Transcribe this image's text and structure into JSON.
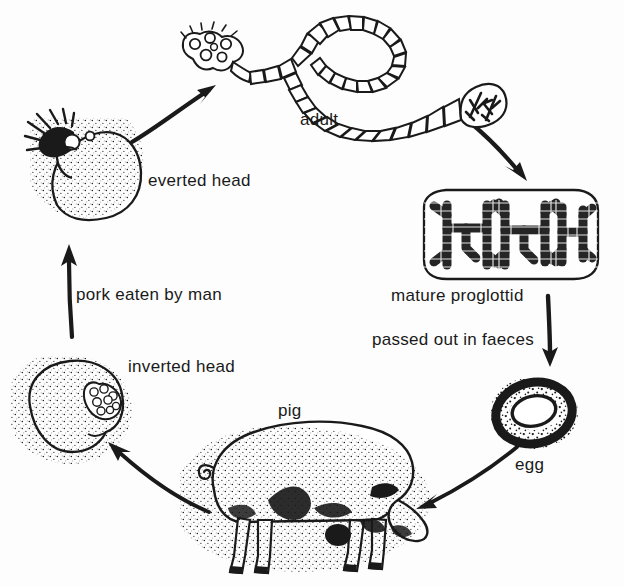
{
  "figure": {
    "kind": "life-cycle-diagram",
    "background_color": "#fdfdfd",
    "ink_color": "#1a1a1a",
    "width": 624,
    "height": 586
  },
  "labels": {
    "adult": "adult",
    "everted_head": "everted head",
    "pork_eaten_by_man": "pork eaten by man",
    "inverted_head": "inverted head",
    "pig": "pig",
    "mature_proglottid": "mature proglottid",
    "passed_out_in_faeces": "passed out in faeces",
    "egg": "egg"
  },
  "stages": [
    {
      "id": "adult",
      "label": "adult",
      "position": "top-centre"
    },
    {
      "id": "mature-proglottid",
      "label": "mature proglottid",
      "position": "right"
    },
    {
      "id": "egg",
      "label": "egg",
      "position": "bottom-right"
    },
    {
      "id": "pig",
      "label": "pig",
      "position": "bottom-centre"
    },
    {
      "id": "inverted-head",
      "label": "inverted head",
      "position": "bottom-left"
    },
    {
      "id": "everted-head",
      "label": "everted head",
      "position": "top-left"
    }
  ],
  "arrows": [
    {
      "id": "everted-to-adult",
      "from": "everted-head",
      "to": "adult",
      "caption": ""
    },
    {
      "id": "adult-to-proglottid",
      "from": "adult",
      "to": "mature-proglottid",
      "caption": ""
    },
    {
      "id": "proglottid-to-egg",
      "from": "mature-proglottid",
      "to": "egg",
      "caption": "passed out in faeces"
    },
    {
      "id": "egg-to-pig",
      "from": "egg",
      "to": "pig",
      "caption": ""
    },
    {
      "id": "pig-to-inverted",
      "from": "pig",
      "to": "inverted-head",
      "caption": ""
    },
    {
      "id": "inverted-to-everted",
      "from": "inverted-head",
      "to": "everted-head",
      "caption": "pork eaten by man"
    }
  ]
}
